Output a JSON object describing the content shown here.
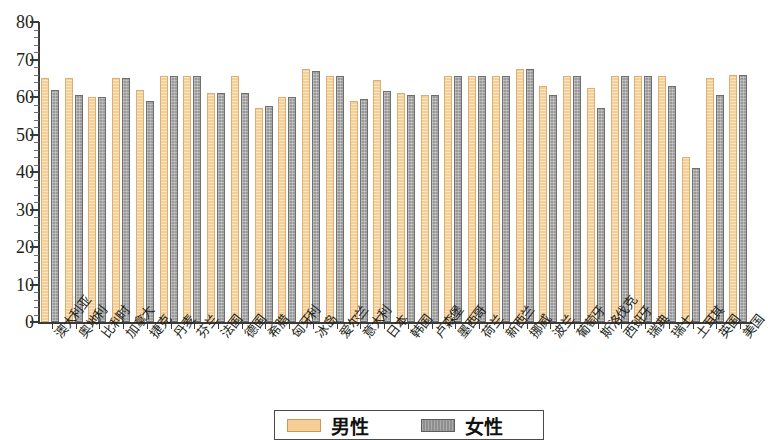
{
  "chart_data": {
    "type": "bar",
    "title": "",
    "xlabel": "",
    "ylabel": "",
    "ylim": [
      0,
      80
    ],
    "ytick_step": 10,
    "grid": false,
    "legend_position": "bottom-center",
    "categories": [
      "澳大利亚",
      "奥地利",
      "比利时",
      "加拿大",
      "捷克",
      "丹麦",
      "芬兰",
      "法国",
      "德国",
      "希腊",
      "匈牙利",
      "冰岛",
      "爱尔兰",
      "意大利",
      "日本",
      "韩国",
      "卢森堡",
      "墨西哥",
      "荷兰",
      "新西兰",
      "挪威",
      "波兰",
      "葡萄牙",
      "斯洛伐克",
      "西班牙",
      "瑞典",
      "瑞士",
      "土耳其",
      "英国",
      "美国"
    ],
    "series": [
      {
        "name": "男性",
        "color": "#f6cf97",
        "values": [
          65,
          65,
          60,
          65,
          62,
          65.5,
          65.5,
          61,
          65.5,
          57,
          60,
          67.5,
          65.5,
          59,
          64.5,
          61,
          60.5,
          65.5,
          65.5,
          65.5,
          67.5,
          63,
          65.5,
          62.5,
          65.5,
          65.5,
          65.5,
          44,
          65,
          66
        ]
      },
      {
        "name": "女性",
        "color": "#9a9a9a",
        "values": [
          62,
          60.5,
          60,
          65,
          59,
          65.5,
          65.5,
          61,
          61,
          57.5,
          60,
          67,
          65.5,
          59.5,
          61.5,
          60.5,
          60.5,
          65.5,
          65.5,
          65.5,
          67.5,
          60.5,
          65.5,
          57,
          65.5,
          65.5,
          63,
          41,
          60.5,
          66
        ]
      }
    ],
    "ytick_labels": [
      "0",
      "10",
      "20",
      "30",
      "40",
      "50",
      "60",
      "70",
      "80"
    ]
  },
  "legend": {
    "items": [
      {
        "label": "男性",
        "swatch": "male-swatch"
      },
      {
        "label": "女性",
        "swatch": "female-swatch"
      }
    ]
  }
}
